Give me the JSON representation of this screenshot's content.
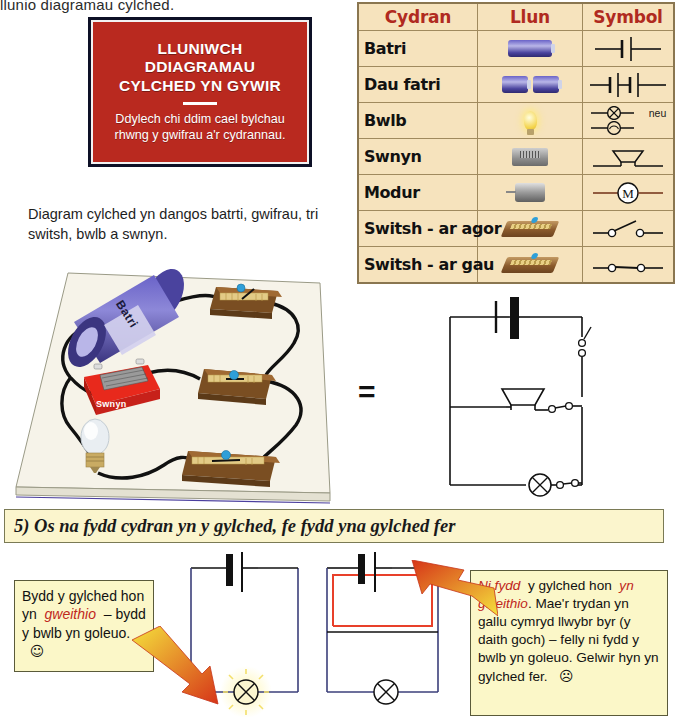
{
  "page": {
    "top_cut_text": "llunio diagramau cylched.",
    "diagram_caption": "Diagram cylched yn dangos batrti, gwifrau, tri switsh, bwlb a swnyn.",
    "equals_symbol": "="
  },
  "warning_sign": {
    "title": "LLUNIWCH DDIAGRAMAU CYLCHED YN GYWIR",
    "title_line1": "LLUNIWCH",
    "title_line2": "DDIAGRAMAU",
    "title_line3": "CYLCHED YN GYWIR",
    "body": "Ddylech chi ddim cael bylchau rhwng y gwifrau a'r cydrannau.",
    "bg_color": "#b9291f",
    "text_color": "#ffffff",
    "border_color": "#0d1026"
  },
  "components_table": {
    "headers": [
      "Cydran",
      "Llun",
      "Symbol"
    ],
    "header_color": "#b02a20",
    "bg_color": "#f6e3bd",
    "border_color": "#a08a5e",
    "or_label": "neu",
    "rows": [
      {
        "name": "Batri",
        "picture": "single-battery-photo",
        "symbol": "battery-symbol"
      },
      {
        "name": "Dau fatri",
        "picture": "two-batteries-photo",
        "symbol": "two-cell-battery-symbol"
      },
      {
        "name": "Bwlb",
        "picture": "light-bulb-photo",
        "symbol": "lamp-cross-symbol"
      },
      {
        "name": "Swnyn",
        "picture": "buzzer-photo",
        "symbol": "buzzer-symbol"
      },
      {
        "name": "Modur",
        "picture": "motor-photo",
        "symbol": "motor-symbol"
      },
      {
        "name": "Switsh - ar agor",
        "picture": "open-switch-photo",
        "symbol": "open-switch-symbol"
      },
      {
        "name": "Switsh - ar gau",
        "picture": "closed-switch-photo",
        "symbol": "closed-switch-symbol"
      }
    ]
  },
  "circuit_photo": {
    "battery_label": "Batri",
    "buzzer_label": "Swnyn"
  },
  "question": {
    "number": "5)",
    "part1": "Os",
    "highlight1": "na fydd cydran",
    "part2": "yn y gylched, fe fydd yna",
    "highlight2": "gylched fer",
    "highlight_color": "#c0271c",
    "bg_color": "#fbf5cd"
  },
  "note_left": {
    "text1": "Bydd y gylched hon yn",
    "emph": "gweithio",
    "text2": "– bydd y bwlb yn goleuo.",
    "emoji": "☺",
    "bg_color": "#fbf7c8"
  },
  "note_right": {
    "emph1": "Ni fydd",
    "text1": "y gylched hon",
    "emph2": "yn gweithio",
    "text2": ". Mae'r trydan yn gallu cymryd llwybr byr (y daith goch) – felly ni fydd y bwlb yn goleuo. Gelwir hyn yn gylched fer.",
    "emoji": "☹",
    "bg_color": "#fbf7c8"
  },
  "bottom_circuits": {
    "working_name": "working-circuit-diagram",
    "short_name": "short-circuit-diagram",
    "short_path_color": "#e8402a",
    "arrow_gradient_start": "#f5e23c",
    "arrow_gradient_end": "#d63418"
  }
}
